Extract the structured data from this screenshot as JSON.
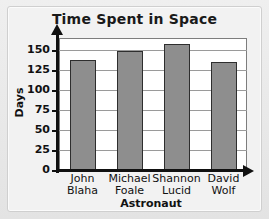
{
  "figure": {
    "border_color": "#cfcfcf",
    "background_color": "#ececec",
    "plot_background": "#ffffff"
  },
  "chart_data": {
    "type": "bar",
    "title": "Time Spent in Space",
    "xlabel": "Astronaut",
    "ylabel": "Days",
    "categories": [
      "John Blaha",
      "Michael Foale",
      "Shannon Lucid",
      "David Wolf"
    ],
    "category_lines": [
      [
        "John",
        "Blaha"
      ],
      [
        "Michael",
        "Foale"
      ],
      [
        "Shannon",
        "Lucid"
      ],
      [
        "David",
        "Wolf"
      ]
    ],
    "values": [
      137,
      149,
      157,
      135
    ],
    "ylim": [
      0,
      165
    ],
    "yticks": [
      0,
      25,
      50,
      75,
      100,
      125,
      150
    ],
    "ytick_labels": [
      "0",
      "25",
      "50",
      "75",
      "100",
      "125",
      "150"
    ],
    "grid": true,
    "legend": null,
    "bar_color": "#8e8e8e",
    "bar_edge_color": "#2e2e2e",
    "axis_color": "#111111",
    "gridline_color": "#9a9a9a"
  }
}
